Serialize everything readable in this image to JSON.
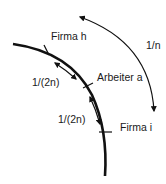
{
  "diagram": {
    "labels": {
      "firma_h": "Firma h",
      "arbeiter_a": "Arbeiter a",
      "firma_i": "Firma i",
      "distance_half_1": "1/(2n)",
      "distance_half_2": "1/(2n)",
      "distance_full": "1/n"
    },
    "colors": {
      "line": "#111111",
      "background": "#ffffff"
    }
  }
}
